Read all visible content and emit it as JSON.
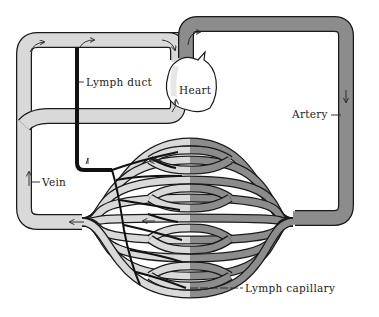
{
  "diagram": {
    "title": "",
    "labels": {
      "lymph_duct": "Lymph duct",
      "heart": "Heart",
      "artery": "Artery",
      "vein": "Vein",
      "lymph_capillary": "Lymph capillary"
    },
    "colors": {
      "vein_fill": "#d9d9d9",
      "artery_fill": "#8c8c8c",
      "outline": "#1a1a1a",
      "lymph": "#111111",
      "heart_fill": "#ffffff"
    },
    "components": [
      {
        "id": "heart",
        "label": "Heart"
      },
      {
        "id": "artery",
        "label": "Artery",
        "flow": "down"
      },
      {
        "id": "vein",
        "label": "Vein",
        "flow": "up"
      },
      {
        "id": "lymph_duct",
        "label": "Lymph duct"
      },
      {
        "id": "lymph_capillary",
        "label": "Lymph capillary"
      },
      {
        "id": "capillary_bed",
        "label": ""
      }
    ]
  }
}
